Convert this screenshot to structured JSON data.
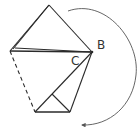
{
  "diagram": {
    "labels": {
      "b": "B",
      "c": "C"
    },
    "colors": {
      "stroke": "#2a2a2a",
      "arc": "#555555",
      "text": "#333333",
      "background": "#ffffff"
    }
  }
}
